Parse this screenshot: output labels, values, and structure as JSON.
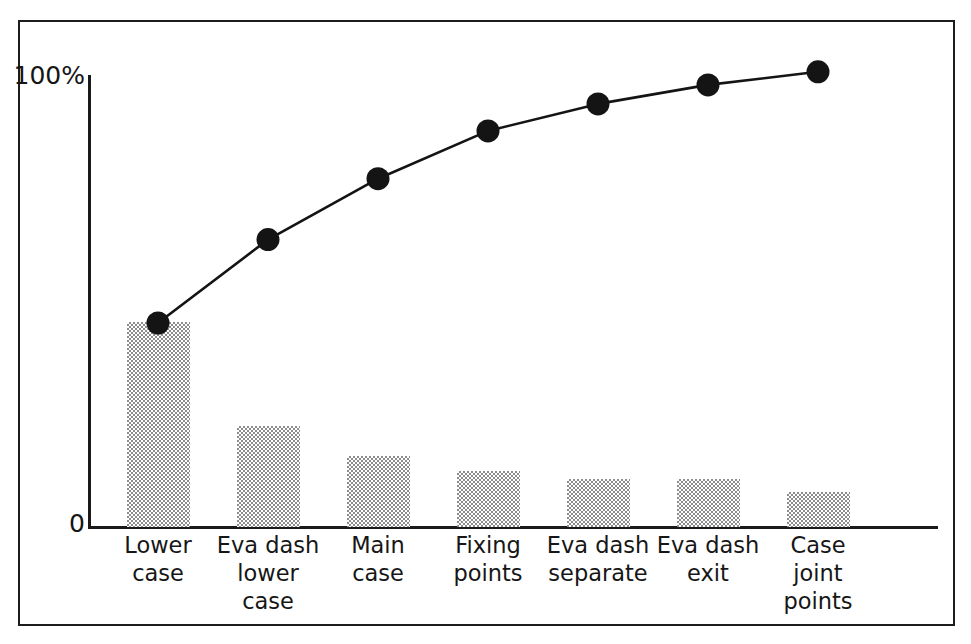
{
  "chart_data": {
    "type": "bar",
    "title": "",
    "subtitle": "",
    "xlabel": "",
    "ylabel": "",
    "legend": [],
    "grid": false,
    "ylim": [
      0,
      100
    ],
    "y_ticks": [
      "0",
      "100%"
    ],
    "categories": [
      "Lower\ncase",
      "Eva dash\nlower\ncase",
      "Main\ncase",
      "Fixing\npoints",
      "Eva dash\nseparate",
      "Eva dash\nexit",
      "Case\njoint\npoints"
    ],
    "series": [
      {
        "name": "Frequency",
        "kind": "bar",
        "values": [
          45.4,
          22.3,
          15.7,
          12.4,
          10.6,
          10.6,
          7.7
        ]
      },
      {
        "name": "Cumulative",
        "kind": "line",
        "values": [
          45.0,
          63.5,
          77.0,
          87.6,
          93.6,
          97.8,
          100.7
        ]
      }
    ],
    "colors": {
      "bar_fill": "#8d8d8d",
      "line": "#141414",
      "marker": "#141414",
      "axis": "#1a1a1a",
      "frame": "#1c1c1c",
      "background": "#ffffff"
    }
  },
  "axis": {
    "y_top_label": "100%",
    "y_zero_label": "0"
  }
}
